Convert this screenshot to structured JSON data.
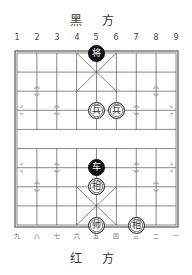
{
  "board": {
    "top_side_label": "黑 方",
    "bottom_side_label": "红 方",
    "top_file_numbers": [
      "1",
      "2",
      "3",
      "4",
      "5",
      "6",
      "7",
      "8",
      "9"
    ],
    "bottom_file_numbers": [
      "九",
      "八",
      "七",
      "六",
      "五",
      "四",
      "三",
      "二",
      "一"
    ],
    "colors": {
      "line": "#555555",
      "black_piece": "#111111",
      "red_piece_fill": "#ffffff"
    },
    "pieces": [
      {
        "side": "black",
        "char": "将",
        "col": 4,
        "row": 0
      },
      {
        "side": "red",
        "char": "兵",
        "col": 4,
        "row": 3
      },
      {
        "side": "red",
        "char": "兵",
        "col": 5,
        "row": 3
      },
      {
        "side": "black",
        "char": "车",
        "col": 4,
        "row": 6
      },
      {
        "side": "red",
        "char": "相",
        "col": 4,
        "row": 7
      },
      {
        "side": "red",
        "char": "帅",
        "col": 4,
        "row": 9
      },
      {
        "side": "red",
        "char": "相",
        "col": 6,
        "row": 9
      }
    ]
  }
}
